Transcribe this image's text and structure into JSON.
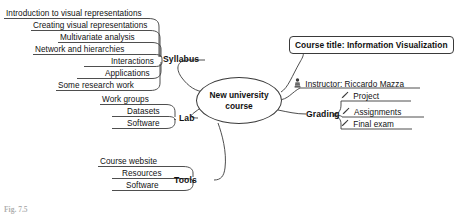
{
  "diagram": {
    "type": "mind-map",
    "center": {
      "label": "New university course"
    },
    "title_box": {
      "label": "Course title: Information Visualization"
    },
    "instructor": {
      "icon": "person-icon",
      "label": "Instructor: Riccardo Mazza"
    },
    "branches": [
      {
        "label": "Syllabus",
        "children": [
          {
            "label": "Introduction to visual representations"
          },
          {
            "label": "Creating visual representations"
          },
          {
            "label": "Multivariate analysis"
          },
          {
            "label": "Network and hierarchies"
          },
          {
            "label": "Interactions"
          },
          {
            "label": "Applications"
          },
          {
            "label": "Some research work"
          }
        ]
      },
      {
        "label": "Lab",
        "children": [
          {
            "label": "Work groups"
          },
          {
            "label": "Datasets"
          },
          {
            "label": "Software"
          }
        ]
      },
      {
        "label": "Tools",
        "children": [
          {
            "label": "Course website"
          },
          {
            "label": "Resources"
          },
          {
            "label": "Software"
          }
        ]
      },
      {
        "label": "Grading",
        "children": [
          {
            "icon": "pen-icon",
            "label": "Project"
          },
          {
            "icon": "pen-icon",
            "label": "Assignments"
          },
          {
            "icon": "pen-icon",
            "label": "Final exam"
          }
        ]
      }
    ],
    "caption": "Fig. 7.5",
    "colors": {
      "stroke": "#3a3a3a",
      "text": "#111111",
      "background": "#ffffff"
    }
  }
}
